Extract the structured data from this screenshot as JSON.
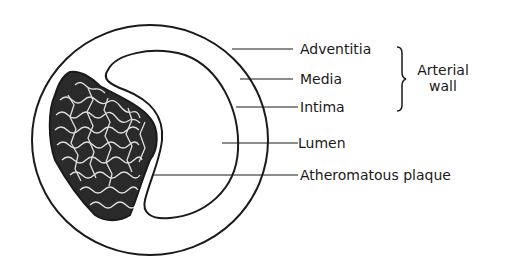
{
  "figure": {
    "type": "cross-section diagram of artery with atherosclerotic plaque",
    "labels": [
      {
        "id": "adventitia",
        "text": "Adventitia"
      },
      {
        "id": "media",
        "text": "Media"
      },
      {
        "id": "intima",
        "text": "Intima"
      },
      {
        "id": "lumen",
        "text": "Lumen"
      },
      {
        "id": "plaque",
        "text": "Atheromatous plaque"
      }
    ],
    "bracket_group": {
      "line1": "Arterial",
      "line2": "wall",
      "members": [
        "Adventitia",
        "Media",
        "Intima"
      ]
    },
    "colors": {
      "ink": "#1a1a1a",
      "background": "#ffffff"
    }
  }
}
